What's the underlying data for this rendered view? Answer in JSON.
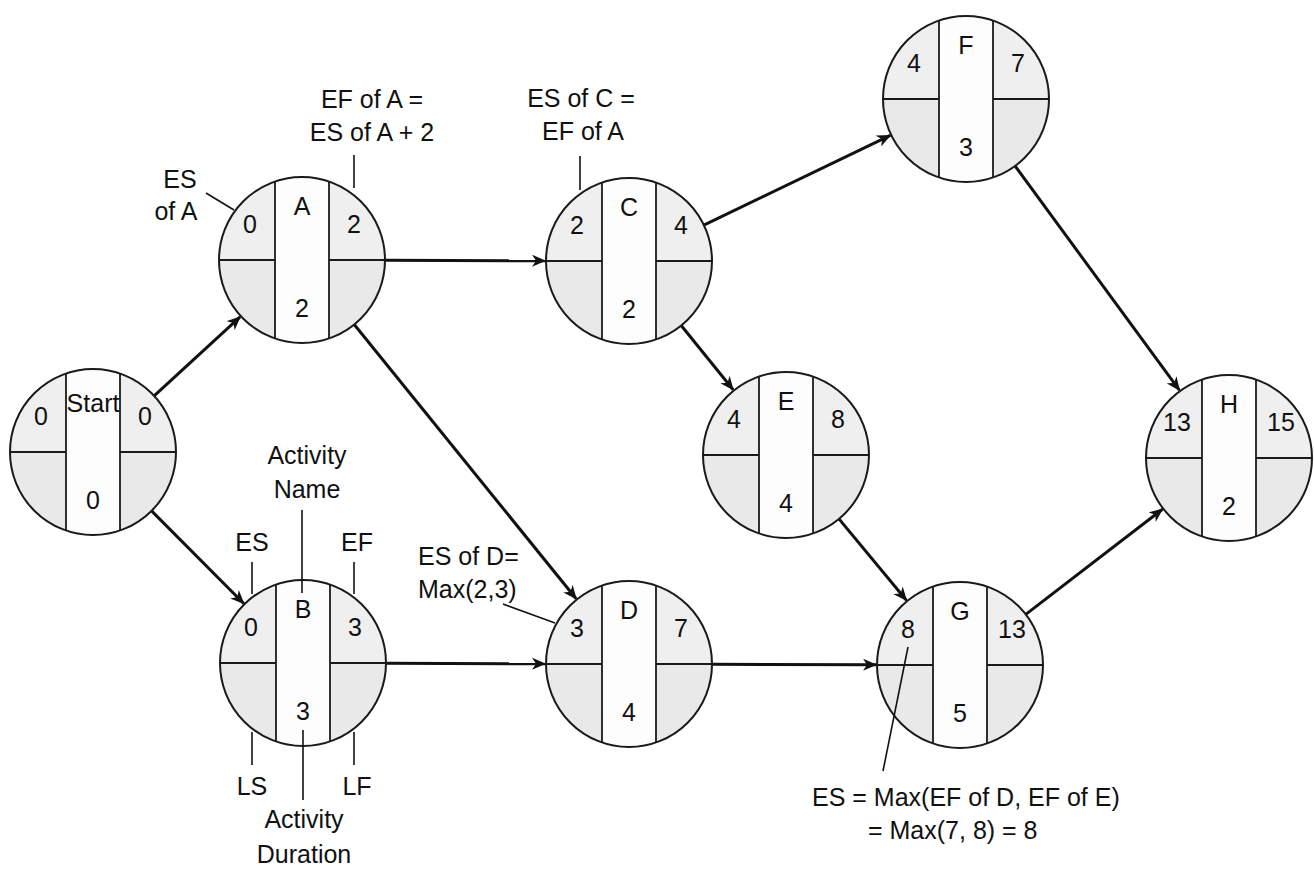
{
  "colors": {
    "quadrant_fill": "#efefef",
    "center_fill": "#fdfdfd",
    "stroke": "#1a1a1a",
    "background": "#ffffff"
  },
  "nodes": [
    {
      "id": "start",
      "name": "Start",
      "es": "0",
      "ef": "0",
      "duration": "0",
      "cx": 93,
      "cy": 452
    },
    {
      "id": "a",
      "name": "A",
      "es": "0",
      "ef": "2",
      "duration": "2",
      "cx": 302,
      "cy": 260
    },
    {
      "id": "b",
      "name": "B",
      "es": "0",
      "ef": "3",
      "duration": "3",
      "cx": 303,
      "cy": 663
    },
    {
      "id": "c",
      "name": "C",
      "es": "2",
      "ef": "4",
      "duration": "2",
      "cx": 629,
      "cy": 261
    },
    {
      "id": "d",
      "name": "D",
      "es": "3",
      "ef": "7",
      "duration": "4",
      "cx": 629,
      "cy": 664
    },
    {
      "id": "e",
      "name": "E",
      "es": "4",
      "ef": "8",
      "duration": "4",
      "cx": 786,
      "cy": 455
    },
    {
      "id": "f",
      "name": "F",
      "es": "4",
      "ef": "7",
      "duration": "3",
      "cx": 966,
      "cy": 99
    },
    {
      "id": "g",
      "name": "G",
      "es": "8",
      "ef": "13",
      "duration": "5",
      "cx": 960,
      "cy": 665
    },
    {
      "id": "h",
      "name": "H",
      "es": "13",
      "ef": "15",
      "duration": "2",
      "cx": 1229,
      "cy": 458
    }
  ],
  "edges": [
    {
      "from": "start",
      "to": "a"
    },
    {
      "from": "start",
      "to": "b"
    },
    {
      "from": "a",
      "to": "c"
    },
    {
      "from": "a",
      "to": "d"
    },
    {
      "from": "b",
      "to": "d"
    },
    {
      "from": "c",
      "to": "f"
    },
    {
      "from": "c",
      "to": "e"
    },
    {
      "from": "d",
      "to": "g"
    },
    {
      "from": "e",
      "to": "g"
    },
    {
      "from": "f",
      "to": "h"
    },
    {
      "from": "g",
      "to": "h"
    }
  ],
  "annotations": {
    "es_of_a": [
      "ES",
      "of A"
    ],
    "ef_of_a": [
      "EF of A =",
      "ES of A + 2"
    ],
    "es_of_c": [
      "ES of C =",
      "EF of A"
    ],
    "activity_name": [
      "Activity",
      "Name"
    ],
    "es_label": "ES",
    "ef_label": "EF",
    "ls_label": "LS",
    "lf_label": "LF",
    "activity_duration": [
      "Activity",
      "Duration"
    ],
    "es_of_d": [
      "ES of D=",
      "Max(2,3)"
    ],
    "es_of_g": [
      "ES = Max(EF of D, EF of E)",
      "= Max(7, 8) = 8"
    ]
  }
}
